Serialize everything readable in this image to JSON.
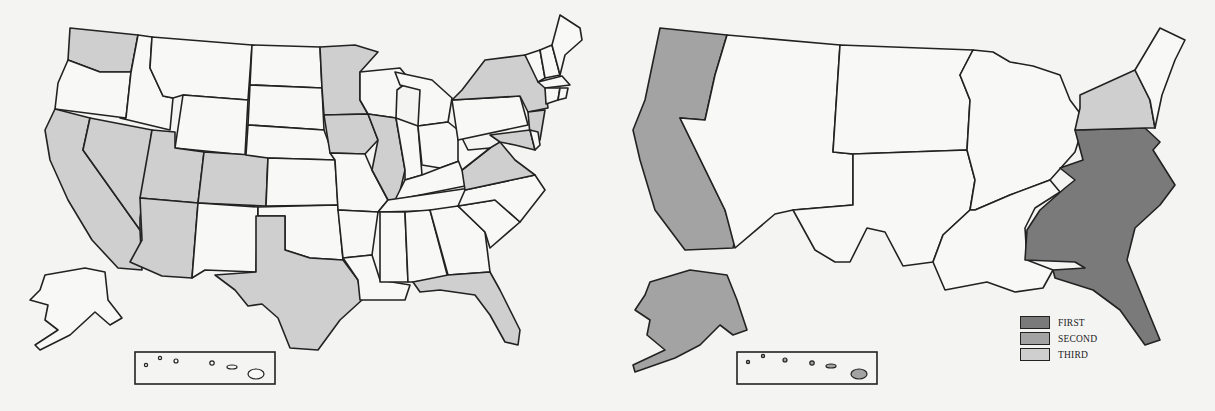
{
  "colors": {
    "first": "#7a7a7a",
    "second": "#a3a3a3",
    "third": "#cfcfcf",
    "shaded": "#cfcfcf",
    "unshaded": "#f8f8f6",
    "border": "#222222"
  },
  "left_map": {
    "shaded_states": [
      "WA",
      "CA",
      "NV",
      "UT",
      "AZ",
      "CO",
      "TX",
      "MN",
      "IA",
      "IL",
      "NY",
      "NJ",
      "MD",
      "VA",
      "FL"
    ]
  },
  "right_map": {
    "regions": [
      {
        "name": "Pacific (WA, OR, CA)",
        "tier": "second"
      },
      {
        "name": "Alaska",
        "tier": "second"
      },
      {
        "name": "Hawaii",
        "tier": "second"
      },
      {
        "name": "Southeast Atlantic",
        "tier": "first"
      },
      {
        "name": "New York / NJ",
        "tier": "third"
      }
    ]
  },
  "legend": {
    "items": [
      {
        "label": "FIRST",
        "tier": "first"
      },
      {
        "label": "SECOND",
        "tier": "second"
      },
      {
        "label": "THIRD",
        "tier": "third"
      }
    ]
  }
}
